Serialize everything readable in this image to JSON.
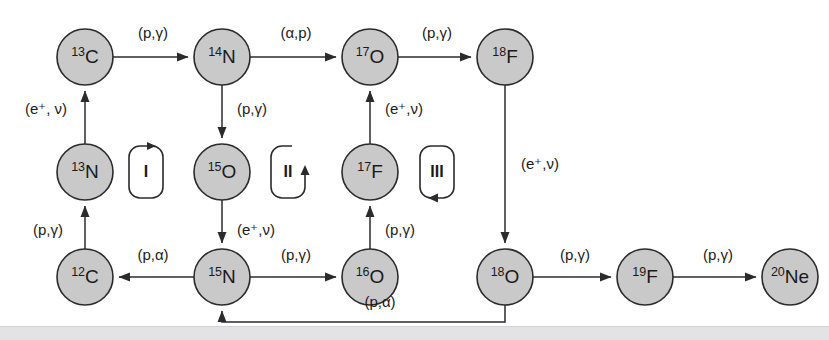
{
  "diagram": {
    "nodes": [
      {
        "id": "c13",
        "mass": "13",
        "element": "C",
        "x": 85,
        "y": 57,
        "r": 28
      },
      {
        "id": "n14",
        "mass": "14",
        "element": "N",
        "x": 222,
        "y": 57,
        "r": 28
      },
      {
        "id": "o17",
        "mass": "17",
        "element": "O",
        "x": 370,
        "y": 57,
        "r": 28
      },
      {
        "id": "f18",
        "mass": "18",
        "element": "F",
        "x": 505,
        "y": 57,
        "r": 28
      },
      {
        "id": "n13",
        "mass": "13",
        "element": "N",
        "x": 85,
        "y": 172,
        "r": 28
      },
      {
        "id": "o15",
        "mass": "15",
        "element": "O",
        "x": 222,
        "y": 172,
        "r": 28
      },
      {
        "id": "f17",
        "mass": "17",
        "element": "F",
        "x": 370,
        "y": 172,
        "r": 28
      },
      {
        "id": "c12",
        "mass": "12",
        "element": "C",
        "x": 85,
        "y": 277,
        "r": 28
      },
      {
        "id": "n15",
        "mass": "15",
        "element": "N",
        "x": 222,
        "y": 277,
        "r": 28
      },
      {
        "id": "o16",
        "mass": "16",
        "element": "O",
        "x": 370,
        "y": 277,
        "r": 28
      },
      {
        "id": "o18",
        "mass": "18",
        "element": "O",
        "x": 505,
        "y": 277,
        "r": 28
      },
      {
        "id": "f19",
        "mass": "19",
        "element": "F",
        "x": 645,
        "y": 277,
        "r": 28
      },
      {
        "id": "ne20",
        "mass": "20",
        "element": "Ne",
        "x": 790,
        "y": 277,
        "r": 28
      }
    ],
    "edges": [
      {
        "id": "c13-n14",
        "from": "c13",
        "to": "n14",
        "label": "(p,γ)",
        "lx": 153,
        "ly": 34
      },
      {
        "id": "n14-o17",
        "from": "n14",
        "to": "o17",
        "label": "(α,p)",
        "lx": 296,
        "ly": 34
      },
      {
        "id": "o17-f18",
        "from": "o17",
        "to": "f18",
        "label": "(p,γ)",
        "lx": 437,
        "ly": 34
      },
      {
        "id": "n13-c13",
        "from": "n13",
        "to": "c13",
        "label": "(e⁺, ν)",
        "lx": 46,
        "ly": 110
      },
      {
        "id": "c12-n13",
        "from": "c12",
        "to": "n13",
        "label": "(p,γ)",
        "lx": 48,
        "ly": 231
      },
      {
        "id": "n14-o15",
        "from": "n14",
        "to": "o15",
        "label": "(p,γ)",
        "lx": 252,
        "ly": 110
      },
      {
        "id": "o15-n15",
        "from": "o15",
        "to": "n15",
        "label": "(e⁺,ν)",
        "lx": 256,
        "ly": 231
      },
      {
        "id": "f17-o17",
        "from": "f17",
        "to": "o17",
        "label": "(e⁺,ν)",
        "lx": 404,
        "ly": 110
      },
      {
        "id": "o16-f17",
        "from": "o16",
        "to": "f17",
        "label": "(p,γ)",
        "lx": 400,
        "ly": 231
      },
      {
        "id": "f18-o18",
        "from": "f18",
        "to": "o18",
        "label": "(e⁺,ν)",
        "lx": 540,
        "ly": 165
      },
      {
        "id": "n15-c12",
        "from": "n15",
        "to": "c12",
        "label": "(p,α)",
        "lx": 153,
        "ly": 256
      },
      {
        "id": "n15-o16",
        "from": "n15",
        "to": "o16",
        "label": "(p,γ)",
        "lx": 296,
        "ly": 256
      },
      {
        "id": "o18-f19",
        "from": "o18",
        "to": "f19",
        "label": "(p,γ)",
        "lx": 575,
        "ly": 256
      },
      {
        "id": "f19-ne20",
        "from": "f19",
        "to": "ne20",
        "label": "(p,γ)",
        "lx": 718,
        "ly": 256
      },
      {
        "id": "o18-n15",
        "from": "o18",
        "to": "n15",
        "label": "(p,α)",
        "lx": 380,
        "ly": 303
      }
    ],
    "cycles": [
      {
        "id": "cycle-1",
        "roman": "I",
        "x": 146,
        "y": 172,
        "direction": "clockwise-top-right"
      },
      {
        "id": "cycle-2",
        "roman": "II",
        "x": 288,
        "y": 172,
        "direction": "counterclockwise-right-up"
      },
      {
        "id": "cycle-3",
        "roman": "III",
        "x": 437,
        "y": 172,
        "direction": "counterclockwise-bottom-left"
      }
    ],
    "colors": {
      "node_fill": "#c9c9c9",
      "node_stroke": "#2b2b2b",
      "edge_stroke": "#2b2b2b",
      "text": "#1a1a1a",
      "footer_band": "#e3e3e5",
      "background": "#ffffff"
    }
  }
}
